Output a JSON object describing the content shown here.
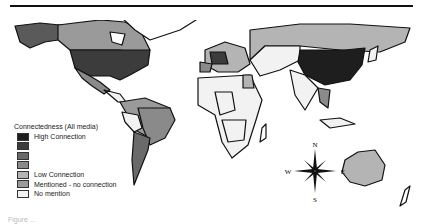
{
  "legend": {
    "title": "Connectedness (All media)",
    "items": [
      {
        "label": "High Connection",
        "color": "#1e1e1e"
      },
      {
        "label": "",
        "color": "#3c3c3c"
      },
      {
        "label": "",
        "color": "#6a6a6a"
      },
      {
        "label": "",
        "color": "#8a8a8a"
      },
      {
        "label": "Low Connection",
        "color": "#b4b4b4"
      },
      {
        "label": "Mentioned - no connection",
        "color": "#9a9a9a"
      },
      {
        "label": "No mention",
        "color": "#f2f2f2"
      }
    ]
  },
  "compass": {
    "n": "N",
    "s": "S",
    "e": "E",
    "w": "W"
  },
  "caption": "Figure ..."
}
